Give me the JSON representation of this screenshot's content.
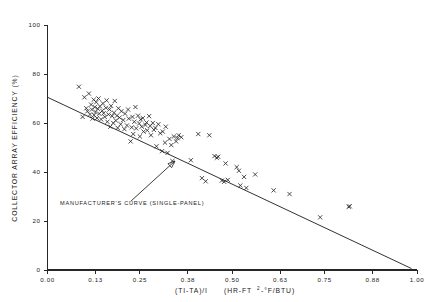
{
  "figure": {
    "background_color": "#ffffff",
    "ink_color": "#262626"
  },
  "annotation": {
    "text": "MANUFACTURER'S CURVE (SINGLE-PANEL)",
    "arrow_tip_x": 0.345,
    "arrow_tip_y": 44.5,
    "arrow_tail_x": 0.225,
    "arrow_tail_y": 28.0
  },
  "axis_titles": {
    "x_part1": "(TI-TA)/I",
    "x_part2": "(HR-FT",
    "x_superscript": "2",
    "x_part3": "-°F/BTU)",
    "y": "COLLECTOR ARRAY EFFICIENCY (%)"
  },
  "chart_data": {
    "type": "scatter",
    "title": "",
    "xlabel": "(TI-TA)/I  (HR-FT2-°F/BTU)",
    "ylabel": "COLLECTOR ARRAY EFFICIENCY (%)",
    "xlim": [
      0.0,
      1.0
    ],
    "ylim": [
      0,
      100
    ],
    "grid": false,
    "legend": "none",
    "marker_symbol": "x",
    "xticks": [
      0.0,
      0.13,
      0.25,
      0.38,
      0.5,
      0.63,
      0.75,
      0.88,
      1.0
    ],
    "xtick_labels": [
      "0.00",
      "0.13",
      "0.25",
      "0.38",
      "0.50",
      "0.63",
      "0.75",
      "0.88",
      "1.00"
    ],
    "yticks": [
      0,
      20,
      40,
      60,
      80,
      100
    ],
    "ytick_labels": [
      "0",
      "20",
      "40",
      "60",
      "80",
      "100"
    ],
    "series": [
      {
        "name": "Measured array efficiency",
        "marker": "x",
        "points": [
          [
            0.085,
            74.8
          ],
          [
            0.095,
            62.5
          ],
          [
            0.1,
            70.5
          ],
          [
            0.105,
            66.0
          ],
          [
            0.108,
            64.8
          ],
          [
            0.112,
            72.0
          ],
          [
            0.115,
            63.5
          ],
          [
            0.118,
            67.5
          ],
          [
            0.12,
            65.5
          ],
          [
            0.122,
            61.8
          ],
          [
            0.125,
            69.5
          ],
          [
            0.126,
            63.2
          ],
          [
            0.128,
            66.5
          ],
          [
            0.13,
            64.5
          ],
          [
            0.132,
            68.5
          ],
          [
            0.134,
            62.0
          ],
          [
            0.136,
            65.8
          ],
          [
            0.138,
            70.0
          ],
          [
            0.14,
            63.8
          ],
          [
            0.142,
            66.8
          ],
          [
            0.145,
            61.5
          ],
          [
            0.148,
            65.0
          ],
          [
            0.15,
            68.0
          ],
          [
            0.152,
            64.0
          ],
          [
            0.155,
            62.5
          ],
          [
            0.158,
            66.2
          ],
          [
            0.16,
            69.2
          ],
          [
            0.162,
            60.5
          ],
          [
            0.165,
            63.5
          ],
          [
            0.168,
            65.5
          ],
          [
            0.17,
            58.5
          ],
          [
            0.172,
            67.0
          ],
          [
            0.175,
            62.8
          ],
          [
            0.178,
            60.0
          ],
          [
            0.18,
            64.2
          ],
          [
            0.182,
            69.0
          ],
          [
            0.185,
            61.0
          ],
          [
            0.188,
            63.0
          ],
          [
            0.19,
            58.0
          ],
          [
            0.192,
            66.0
          ],
          [
            0.195,
            62.2
          ],
          [
            0.198,
            59.5
          ],
          [
            0.2,
            64.8
          ],
          [
            0.205,
            61.2
          ],
          [
            0.208,
            57.5
          ],
          [
            0.21,
            63.8
          ],
          [
            0.215,
            59.0
          ],
          [
            0.218,
            65.5
          ],
          [
            0.22,
            61.8
          ],
          [
            0.225,
            52.5
          ],
          [
            0.228,
            58.2
          ],
          [
            0.23,
            62.5
          ],
          [
            0.232,
            55.5
          ],
          [
            0.235,
            60.5
          ],
          [
            0.238,
            66.5
          ],
          [
            0.24,
            57.8
          ],
          [
            0.245,
            63.0
          ],
          [
            0.248,
            59.8
          ],
          [
            0.25,
            54.5
          ],
          [
            0.252,
            61.5
          ],
          [
            0.255,
            58.5
          ],
          [
            0.258,
            62.0
          ],
          [
            0.26,
            56.5
          ],
          [
            0.265,
            59.2
          ],
          [
            0.268,
            60.2
          ],
          [
            0.27,
            57.0
          ],
          [
            0.275,
            62.8
          ],
          [
            0.278,
            58.8
          ],
          [
            0.28,
            55.0
          ],
          [
            0.285,
            60.0
          ],
          [
            0.288,
            57.2
          ],
          [
            0.292,
            58.0
          ],
          [
            0.295,
            50.5
          ],
          [
            0.3,
            59.5
          ],
          [
            0.305,
            55.8
          ],
          [
            0.31,
            48.5
          ],
          [
            0.312,
            56.5
          ],
          [
            0.318,
            52.0
          ],
          [
            0.32,
            58.5
          ],
          [
            0.325,
            47.8
          ],
          [
            0.33,
            53.5
          ],
          [
            0.335,
            51.0
          ],
          [
            0.338,
            44.5
          ],
          [
            0.342,
            54.5
          ],
          [
            0.348,
            52.5
          ],
          [
            0.352,
            53.8
          ],
          [
            0.355,
            55.0
          ],
          [
            0.362,
            54.2
          ],
          [
            0.388,
            44.8
          ],
          [
            0.408,
            55.5
          ],
          [
            0.418,
            37.5
          ],
          [
            0.428,
            36.2
          ],
          [
            0.438,
            55.0
          ],
          [
            0.452,
            46.5
          ],
          [
            0.458,
            45.8
          ],
          [
            0.462,
            46.2
          ],
          [
            0.472,
            36.5
          ],
          [
            0.478,
            36.0
          ],
          [
            0.482,
            43.5
          ],
          [
            0.488,
            36.8
          ],
          [
            0.512,
            42.0
          ],
          [
            0.518,
            40.5
          ],
          [
            0.522,
            34.5
          ],
          [
            0.532,
            38.0
          ],
          [
            0.538,
            33.5
          ],
          [
            0.562,
            39.0
          ],
          [
            0.612,
            32.5
          ],
          [
            0.655,
            31.0
          ],
          [
            0.738,
            21.5
          ],
          [
            0.818,
            26.0
          ],
          [
            0.815,
            25.8
          ]
        ]
      }
    ],
    "reference_line": {
      "name": "MANUFACTURER'S CURVE (SINGLE-PANEL)",
      "x_start": 0.0,
      "y_start": 70.5,
      "x_end": 0.985,
      "y_end": 0.6
    }
  }
}
